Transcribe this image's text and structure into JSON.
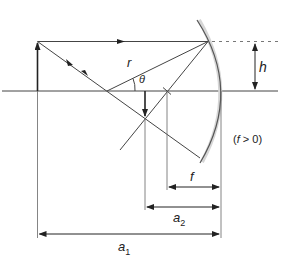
{
  "diagram": {
    "type": "concave-mirror-ray-diagram",
    "labels": {
      "radius": "r",
      "angle": "θ",
      "height": "h",
      "focal_length": "f",
      "image_distance": "a",
      "image_distance_sub": "2",
      "object_distance": "a",
      "object_distance_sub": "1",
      "condition_open": "(",
      "condition_var": "f",
      "condition_rest": " > 0)"
    },
    "colors": {
      "line": "#333333",
      "mirror": "#555555",
      "mirror_shade": "#cfcfcf",
      "dashed": "#777777"
    }
  }
}
